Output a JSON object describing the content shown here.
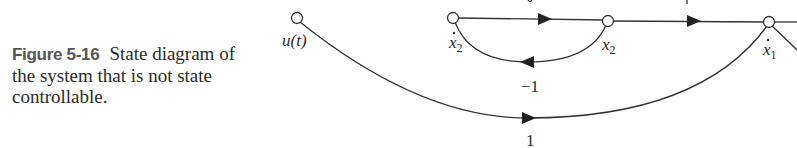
{
  "caption": {
    "figure_number": "Figure 5-16",
    "text": "State diagram of the system that is not state controllable."
  },
  "diagram": {
    "type": "signal-flow-graph",
    "nodes": [
      {
        "id": "u",
        "label": "u(t)"
      },
      {
        "id": "x2dot",
        "label": "ẋ2"
      },
      {
        "id": "x2",
        "label": "x2"
      },
      {
        "id": "x1dot",
        "label": "ẋ1"
      }
    ],
    "edges": [
      {
        "from": "x2dot",
        "to": "x2",
        "gain": "s⁻¹ (cut off)"
      },
      {
        "from": "x2",
        "to": "x2dot",
        "gain": "−1"
      },
      {
        "from": "x2",
        "to": "x1dot",
        "gain": "1 (cut off)"
      },
      {
        "from": "u",
        "to": "x1dot",
        "gain": "1"
      }
    ],
    "labels": {
      "u": "u(t)",
      "x2dot_base": "x",
      "x2dot_sub": "2",
      "x2_base": "x",
      "x2_sub": "2",
      "x1dot_base": "x",
      "x1dot_sub": "1",
      "feedback_gain": "−1",
      "input_gain": "1"
    }
  }
}
